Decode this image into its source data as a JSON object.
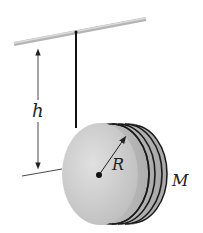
{
  "diagram": {
    "labels": {
      "height": "h",
      "radius": "R",
      "mass": "M"
    },
    "colors": {
      "bar": "#c8c8c8",
      "disk_face": "#d4d4d4",
      "disk_rim": "#b8b8b8",
      "string": "#111111",
      "arrows": "#333333"
    },
    "icons": [
      "ceiling-bar",
      "string",
      "disk",
      "height-arrow",
      "radius-arrow",
      "center-dot"
    ]
  }
}
